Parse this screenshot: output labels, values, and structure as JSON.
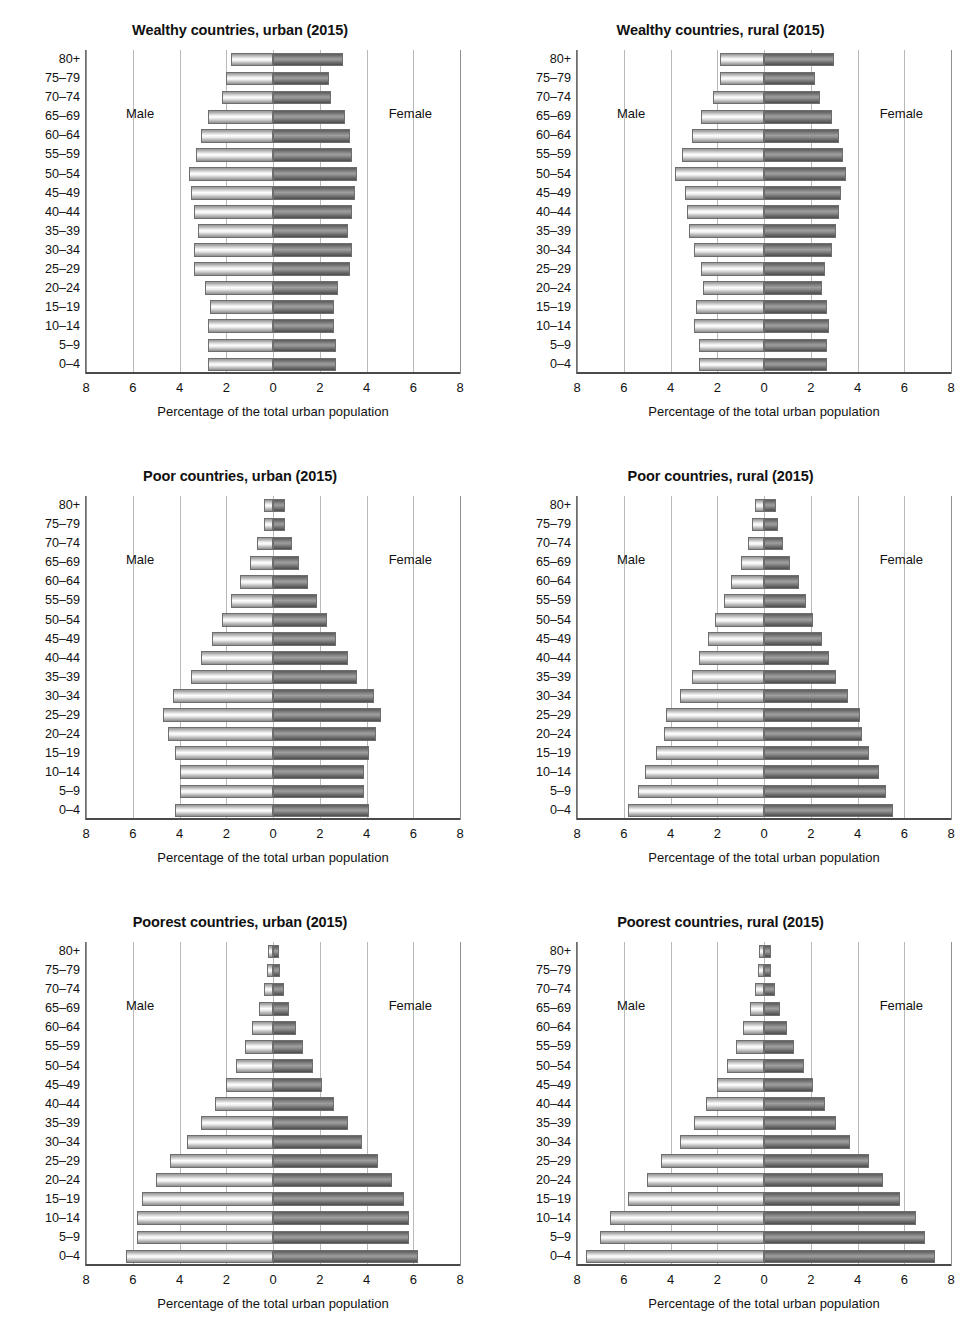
{
  "figure": {
    "axis_label": "Percentage of the total urban population",
    "male_label": "Male",
    "female_label": "Female",
    "age_groups": [
      "0–4",
      "5–9",
      "10–14",
      "15–19",
      "20–24",
      "25–29",
      "30–34",
      "35–39",
      "40–44",
      "45–49",
      "50–54",
      "55–59",
      "60–64",
      "65–69",
      "70–74",
      "75–79",
      "80+"
    ],
    "xticks": [
      "8",
      "6",
      "4",
      "2",
      "0",
      "2",
      "4",
      "6",
      "8"
    ],
    "xlim": 8,
    "colors": {
      "male_bar": "#e8e8e8",
      "female_bar": "#8a8a8a",
      "gridline": "#b9b9b9",
      "axis": "#4a4a4a",
      "text": "#111111"
    }
  },
  "chart_data": [
    {
      "type": "bar",
      "title": "Wealthy countries, urban (2015)",
      "xlabel": "Percentage of the total urban population",
      "ylabel": "",
      "xlim": [
        -8,
        8
      ],
      "grid": true,
      "legend": [
        "Male",
        "Female"
      ],
      "categories": [
        "0–4",
        "5–9",
        "10–14",
        "15–19",
        "20–24",
        "25–29",
        "30–34",
        "35–39",
        "40–44",
        "45–49",
        "50–54",
        "55–59",
        "60–64",
        "65–69",
        "70–74",
        "75–79",
        "80+"
      ],
      "series": [
        {
          "name": "Male",
          "values": [
            2.8,
            2.8,
            2.8,
            2.7,
            2.9,
            3.4,
            3.4,
            3.2,
            3.4,
            3.5,
            3.6,
            3.3,
            3.1,
            2.8,
            2.2,
            2.0,
            1.8
          ]
        },
        {
          "name": "Female",
          "values": [
            2.7,
            2.7,
            2.6,
            2.6,
            2.8,
            3.3,
            3.4,
            3.2,
            3.4,
            3.5,
            3.6,
            3.4,
            3.3,
            3.1,
            2.5,
            2.4,
            3.0
          ]
        }
      ]
    },
    {
      "type": "bar",
      "title": "Wealthy countries, rural (2015)",
      "xlabel": "Percentage of the total urban population",
      "ylabel": "",
      "xlim": [
        -8,
        8
      ],
      "grid": true,
      "legend": [
        "Male",
        "Female"
      ],
      "categories": [
        "0–4",
        "5–9",
        "10–14",
        "15–19",
        "20–24",
        "25–29",
        "30–34",
        "35–39",
        "40–44",
        "45–49",
        "50–54",
        "55–59",
        "60–64",
        "65–69",
        "70–74",
        "75–79",
        "80+"
      ],
      "series": [
        {
          "name": "Male",
          "values": [
            2.8,
            2.8,
            3.0,
            2.9,
            2.6,
            2.7,
            3.0,
            3.2,
            3.3,
            3.4,
            3.8,
            3.5,
            3.1,
            2.7,
            2.2,
            1.9,
            1.9
          ]
        },
        {
          "name": "Female",
          "values": [
            2.7,
            2.7,
            2.8,
            2.7,
            2.5,
            2.6,
            2.9,
            3.1,
            3.2,
            3.3,
            3.5,
            3.4,
            3.2,
            2.9,
            2.4,
            2.2,
            3.0
          ]
        }
      ]
    },
    {
      "type": "bar",
      "title": "Poor countries, urban (2015)",
      "xlabel": "Percentage of the total urban population",
      "ylabel": "",
      "xlim": [
        -8,
        8
      ],
      "grid": true,
      "legend": [
        "Male",
        "Female"
      ],
      "categories": [
        "0–4",
        "5–9",
        "10–14",
        "15–19",
        "20–24",
        "25–29",
        "30–34",
        "35–39",
        "40–44",
        "45–49",
        "50–54",
        "55–59",
        "60–64",
        "65–69",
        "70–74",
        "75–79",
        "80+"
      ],
      "series": [
        {
          "name": "Male",
          "values": [
            4.2,
            4.0,
            4.0,
            4.2,
            4.5,
            4.7,
            4.3,
            3.5,
            3.1,
            2.6,
            2.2,
            1.8,
            1.4,
            1.0,
            0.7,
            0.4,
            0.4
          ]
        },
        {
          "name": "Female",
          "values": [
            4.1,
            3.9,
            3.9,
            4.1,
            4.4,
            4.6,
            4.3,
            3.6,
            3.2,
            2.7,
            2.3,
            1.9,
            1.5,
            1.1,
            0.8,
            0.5,
            0.5
          ]
        }
      ]
    },
    {
      "type": "bar",
      "title": "Poor countries, rural (2015)",
      "xlabel": "Percentage of the total urban population",
      "ylabel": "",
      "xlim": [
        -8,
        8
      ],
      "grid": true,
      "legend": [
        "Male",
        "Female"
      ],
      "categories": [
        "0–4",
        "5–9",
        "10–14",
        "15–19",
        "20–24",
        "25–29",
        "30–34",
        "35–39",
        "40–44",
        "45–49",
        "50–54",
        "55–59",
        "60–64",
        "65–69",
        "70–74",
        "75–79",
        "80+"
      ],
      "series": [
        {
          "name": "Male",
          "values": [
            5.8,
            5.4,
            5.1,
            4.6,
            4.3,
            4.2,
            3.6,
            3.1,
            2.8,
            2.4,
            2.1,
            1.7,
            1.4,
            1.0,
            0.7,
            0.5,
            0.4
          ]
        },
        {
          "name": "Female",
          "values": [
            5.5,
            5.2,
            4.9,
            4.5,
            4.2,
            4.1,
            3.6,
            3.1,
            2.8,
            2.5,
            2.1,
            1.8,
            1.5,
            1.1,
            0.8,
            0.6,
            0.5
          ]
        }
      ]
    },
    {
      "type": "bar",
      "title": "Poorest countries, urban (2015)",
      "xlabel": "Percentage of the total urban population",
      "ylabel": "",
      "xlim": [
        -8,
        8
      ],
      "grid": true,
      "legend": [
        "Male",
        "Female"
      ],
      "categories": [
        "0–4",
        "5–9",
        "10–14",
        "15–19",
        "20–24",
        "25–29",
        "30–34",
        "35–39",
        "40–44",
        "45–49",
        "50–54",
        "55–59",
        "60–64",
        "65–69",
        "70–74",
        "75–79",
        "80+"
      ],
      "series": [
        {
          "name": "Male",
          "values": [
            6.3,
            5.8,
            5.8,
            5.6,
            5.0,
            4.4,
            3.7,
            3.1,
            2.5,
            2.0,
            1.6,
            1.2,
            0.9,
            0.6,
            0.4,
            0.25,
            0.2
          ]
        },
        {
          "name": "Female",
          "values": [
            6.2,
            5.8,
            5.8,
            5.6,
            5.1,
            4.5,
            3.8,
            3.2,
            2.6,
            2.1,
            1.7,
            1.3,
            1.0,
            0.7,
            0.45,
            0.3,
            0.25
          ]
        }
      ]
    },
    {
      "type": "bar",
      "title": "Poorest countries, rural (2015)",
      "xlabel": "Percentage of the total urban population",
      "ylabel": "",
      "xlim": [
        -8,
        8
      ],
      "grid": true,
      "legend": [
        "Male",
        "Female"
      ],
      "categories": [
        "0–4",
        "5–9",
        "10–14",
        "15–19",
        "20–24",
        "25–29",
        "30–34",
        "35–39",
        "40–44",
        "45–49",
        "50–54",
        "55–59",
        "60–64",
        "65–69",
        "70–74",
        "75–79",
        "80+"
      ],
      "series": [
        {
          "name": "Male",
          "values": [
            7.6,
            7.0,
            6.6,
            5.8,
            5.0,
            4.4,
            3.6,
            3.0,
            2.5,
            2.0,
            1.6,
            1.2,
            0.9,
            0.6,
            0.4,
            0.25,
            0.2
          ]
        },
        {
          "name": "Female",
          "values": [
            7.3,
            6.9,
            6.5,
            5.8,
            5.1,
            4.5,
            3.7,
            3.1,
            2.6,
            2.1,
            1.7,
            1.3,
            1.0,
            0.7,
            0.45,
            0.3,
            0.3
          ]
        }
      ]
    }
  ]
}
